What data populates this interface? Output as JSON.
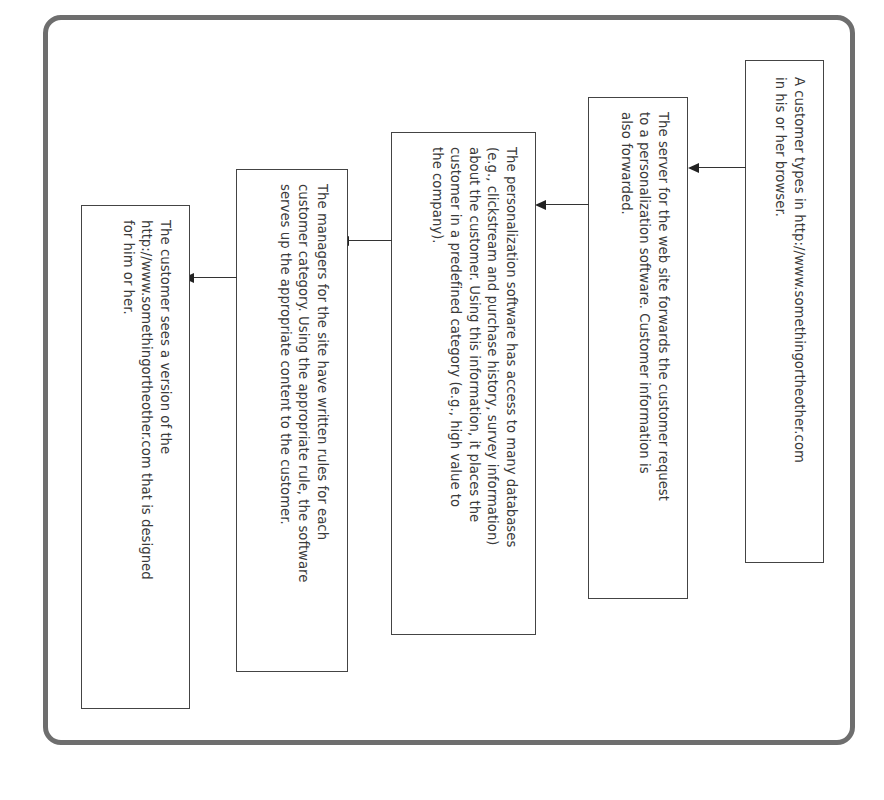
{
  "diagram": {
    "type": "flowchart",
    "orientation": "rotated 90deg clockwise (read top-to-bottom, flow right-to-left)",
    "steps": [
      {
        "id": 1,
        "text": "A customer types in http://www.somethingortheother.com\nin his or her browser."
      },
      {
        "id": 2,
        "text": "The server for the web site forwards the customer request\nto a personalization software. Customer information is\nalso forwarded."
      },
      {
        "id": 3,
        "text": "The personalization software has access to many databases\n(e.g., clickstream and purchase history, survey information)\nabout the customer. Using this information, it places the\ncustomer in a predefined category (e.g., high value to\nthe company)."
      },
      {
        "id": 4,
        "text": "The managers for the site have written rules for each\ncustomer category. Using the appropriate rule, the software\nserves up the appropriate content to the customer."
      },
      {
        "id": 5,
        "text": "The customer sees a version of the\nhttp://www.somethingortheother.com that is designed\nfor him or her."
      }
    ],
    "edges": [
      {
        "from": 1,
        "to": 2
      },
      {
        "from": 2,
        "to": 3
      },
      {
        "from": 3,
        "to": 4
      },
      {
        "from": 4,
        "to": 5
      }
    ],
    "colors": {
      "frame": "#6e6e6e",
      "box_border": "#444444",
      "text": "#3a3a3a",
      "arrow": "#222222"
    }
  }
}
